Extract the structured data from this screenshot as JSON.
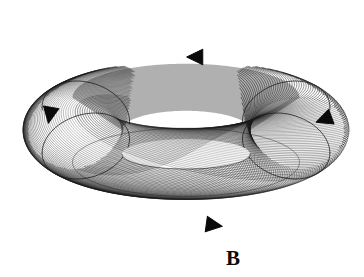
{
  "figure": {
    "label": "B",
    "label_position": {
      "x": 226,
      "y": 248
    },
    "caption_style": "bold-serif",
    "background_color": "#ffffff",
    "ink_color": "#111111",
    "rendering_style": "helical-contour-line-hatching"
  },
  "torus": {
    "name": "toroidal-surface",
    "center": {
      "x": 186,
      "y": 130
    },
    "outer_radius_x": 163,
    "outer_radius_y": 108,
    "hole_radius_x": 64,
    "hole_radius_y": 15,
    "hole_center": {
      "x": 186,
      "y": 154
    },
    "tube_count": 120,
    "bounds": {
      "left": 23,
      "top": 22,
      "right": 348,
      "bottom": 237
    },
    "hole_fill": "#ffffff",
    "shading": {
      "inner_wall_tone": "#6f6f6f",
      "outer_body_tone": "#ffffff",
      "line_tone": "#1a1a1a"
    }
  },
  "arrows": [
    {
      "name": "arrow-top",
      "label": "top direction marker",
      "x": 196,
      "y": 57,
      "direction": "left",
      "rotation_deg": 180,
      "size": 13,
      "color": "#0a0a0a"
    },
    {
      "name": "arrow-left",
      "label": "left direction marker",
      "x": 50,
      "y": 114,
      "direction": "down",
      "rotation_deg": 100,
      "size": 13,
      "color": "#0a0a0a"
    },
    {
      "name": "arrow-right",
      "label": "right direction marker",
      "x": 325,
      "y": 119,
      "direction": "down-left",
      "rotation_deg": 160,
      "size": 13,
      "color": "#0a0a0a"
    },
    {
      "name": "arrow-bottom",
      "label": "bottom direction marker",
      "x": 213,
      "y": 225,
      "direction": "right",
      "rotation_deg": 8,
      "size": 13,
      "color": "#0a0a0a"
    }
  ],
  "seams": [
    {
      "name": "seam-upper-left",
      "u_deg": 152
    },
    {
      "name": "seam-upper-right",
      "u_deg": 28
    },
    {
      "name": "seam-lower-left",
      "u_deg": 208
    },
    {
      "name": "seam-lower-right",
      "u_deg": 332
    }
  ]
}
